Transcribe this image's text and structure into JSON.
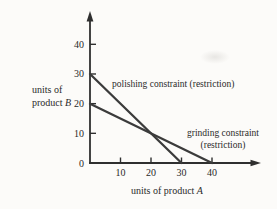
{
  "chart_data": {
    "type": "line",
    "title": "",
    "xlabel": "units of product A",
    "ylabel": "units of product B",
    "xlabel_text": "units of product",
    "xlabel_var": "A",
    "ylabel_lines": [
      "units of",
      "product"
    ],
    "ylabel_var": "B",
    "origin_label": "0",
    "x_ticks": [
      10,
      20,
      30,
      40
    ],
    "y_ticks": [
      10,
      20,
      30,
      40
    ],
    "xlim": [
      0,
      47
    ],
    "ylim": [
      0,
      50
    ],
    "grid": false,
    "legend": "none",
    "series": [
      {
        "name": "polishing constraint",
        "points": [
          [
            0,
            30
          ],
          [
            30,
            0
          ]
        ],
        "label": "polishing constraint (restriction)"
      },
      {
        "name": "grinding constraint",
        "points": [
          [
            0,
            20
          ],
          [
            40,
            0
          ]
        ],
        "label": "grinding constraint (restriction)"
      }
    ],
    "annotations": [
      {
        "lines": [
          "polishing constraint (restriction)"
        ]
      },
      {
        "lines": [
          "grinding constraint",
          "(restriction)"
        ]
      }
    ],
    "colors": {
      "line": "#3b3b3b",
      "axis": "#2f2f2f",
      "text": "#2a2a2a",
      "background": "#fcfbf9"
    }
  }
}
